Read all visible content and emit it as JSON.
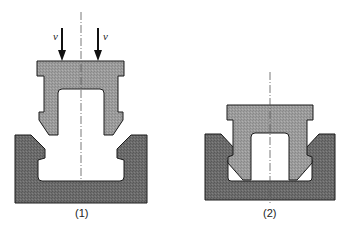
{
  "figure": {
    "type": "technical cross-section diagram",
    "panels": [
      {
        "id": "1",
        "caption": "(1)",
        "arrow_labels": [
          "v",
          "v"
        ],
        "description": "Punch part above open channel, with downward force arrows"
      },
      {
        "id": "2",
        "caption": "(2)",
        "description": "Punch part pressed/snapped into channel"
      }
    ]
  },
  "colors": {
    "upper_part_fill": "#9a9a9a",
    "lower_part_fill": "#6a6a6a",
    "outline": "#1a1a1a",
    "centerline": "#555555",
    "background": "#ffffff"
  }
}
